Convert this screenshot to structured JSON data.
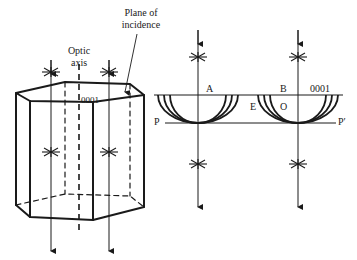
{
  "figure": {
    "labels": {
      "plane_of_incidence_line1": "Plane of",
      "plane_of_incidence_line2": "incidence",
      "optic_axis_line1": "Optic",
      "optic_axis_line2": "axis",
      "crystal_face": "0001",
      "point_a": "A",
      "point_b": "B",
      "point_e": "E",
      "point_o": "O",
      "right_face": "0001",
      "plane_p": "P",
      "plane_p_prime": "P′"
    },
    "colors": {
      "ink": "#1a1a1a",
      "background": "#ffffff"
    }
  }
}
